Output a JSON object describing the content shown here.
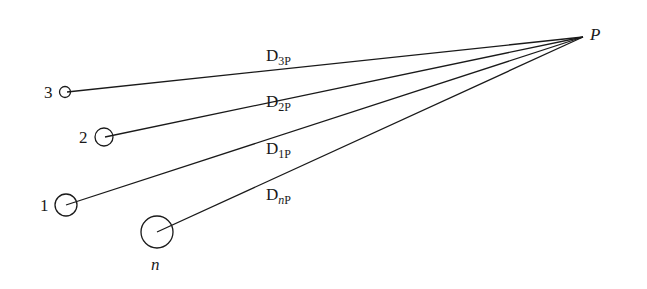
{
  "diagram": {
    "target_point": {
      "label": "P"
    },
    "conductors": [
      {
        "id": "3",
        "label": "3"
      },
      {
        "id": "2",
        "label": "2"
      },
      {
        "id": "1",
        "label": "1"
      },
      {
        "id": "n",
        "label": "n"
      }
    ],
    "distances": [
      {
        "from": "3",
        "main": "D",
        "sub_a": "3",
        "sub_b": "P"
      },
      {
        "from": "2",
        "main": "D",
        "sub_a": "2",
        "sub_b": "P"
      },
      {
        "from": "1",
        "main": "D",
        "sub_a": "1",
        "sub_b": "P"
      },
      {
        "from": "n",
        "main": "D",
        "sub_a": "n",
        "sub_b": "P"
      }
    ]
  }
}
